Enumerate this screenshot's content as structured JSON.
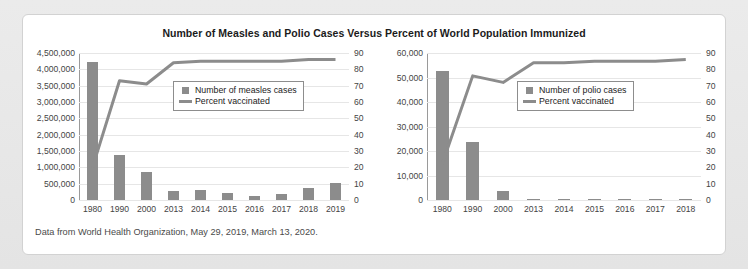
{
  "title": "Number of Measles and Polio Cases Versus Percent of World Population Immunized",
  "caption": "Data from World Health Organization, May 29, 2019, March 13, 2020.",
  "colors": {
    "bar": "#8c8c8c",
    "line": "#8c8c8c",
    "grid": "#e6e6e6",
    "axis": "#9a9a9a"
  },
  "chart_data": [
    {
      "type": "bar",
      "title": "Number of Measles and Polio Cases Versus Percent of World Population Immunized",
      "panel": "measles",
      "xlabel": "",
      "ylabel": "",
      "categories": [
        "1980",
        "1990",
        "2000",
        "2013",
        "2014",
        "2015",
        "2016",
        "2017",
        "2018",
        "2019"
      ],
      "series": [
        {
          "name": "Number of measles cases",
          "type": "bar",
          "axis": "left",
          "values": [
            4211431,
            1374083,
            853479,
            278358,
            294367,
            214808,
            132490,
            173330,
            353236,
            521811
          ]
        },
        {
          "name": "Percent vaccinated",
          "type": "line",
          "axis": "right",
          "values": [
            20,
            73,
            71,
            84,
            85,
            85,
            85,
            85,
            86,
            86
          ]
        }
      ],
      "ylim": [
        0,
        4500000
      ],
      "yticks": [
        "0",
        "500,000",
        "1,000,000",
        "1,500,000",
        "2,000,000",
        "2,500,000",
        "3,000,000",
        "3,500,000",
        "4,000,000",
        "4,500,000"
      ],
      "y2lim": [
        0,
        90
      ],
      "y2ticks": [
        "0",
        "10",
        "20",
        "30",
        "40",
        "50",
        "60",
        "70",
        "80",
        "90"
      ],
      "grid": true,
      "legend_position": "inside-upper-center",
      "legend": [
        "Number of measles cases",
        "Percent vaccinated"
      ]
    },
    {
      "type": "bar",
      "panel": "polio",
      "xlabel": "",
      "ylabel": "",
      "categories": [
        "1980",
        "1990",
        "2000",
        "2013",
        "2014",
        "2015",
        "2016",
        "2017",
        "2018"
      ],
      "series": [
        {
          "name": "Number of polio cases",
          "type": "bar",
          "axis": "left",
          "values": [
            52552,
            23484,
            3500,
            416,
            359,
            114,
            42,
            33,
            33
          ]
        },
        {
          "name": "Percent vaccinated",
          "type": "line",
          "axis": "right",
          "values": [
            22,
            76,
            72,
            84,
            84,
            85,
            85,
            85,
            86
          ]
        }
      ],
      "ylim": [
        0,
        60000
      ],
      "yticks": [
        "0",
        "10,000",
        "20,000",
        "30,000",
        "40,000",
        "50,000",
        "60,000"
      ],
      "y2lim": [
        0,
        90
      ],
      "y2ticks": [
        "0",
        "10",
        "20",
        "30",
        "40",
        "50",
        "60",
        "70",
        "80",
        "90"
      ],
      "grid": true,
      "legend_position": "inside-upper-center",
      "legend": [
        "Number of polio cases",
        "Percent vaccinated"
      ]
    }
  ]
}
